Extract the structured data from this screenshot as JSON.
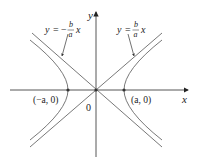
{
  "figure": {
    "type": "hyperbola",
    "axes": {
      "x_label": "x",
      "y_label": "y",
      "origin_label": "0"
    },
    "asymptotes": {
      "negative": {
        "lhs": "y",
        "eq": "=",
        "sign": "−",
        "num": "b",
        "den": "a",
        "var": "x"
      },
      "positive": {
        "lhs": "y",
        "eq": "=",
        "num": "b",
        "den": "a",
        "var": "x"
      }
    },
    "vertices": {
      "left": "(−a, 0)",
      "right": "(a, 0)"
    },
    "colors": {
      "line": "#444444",
      "text": "#222222"
    }
  }
}
